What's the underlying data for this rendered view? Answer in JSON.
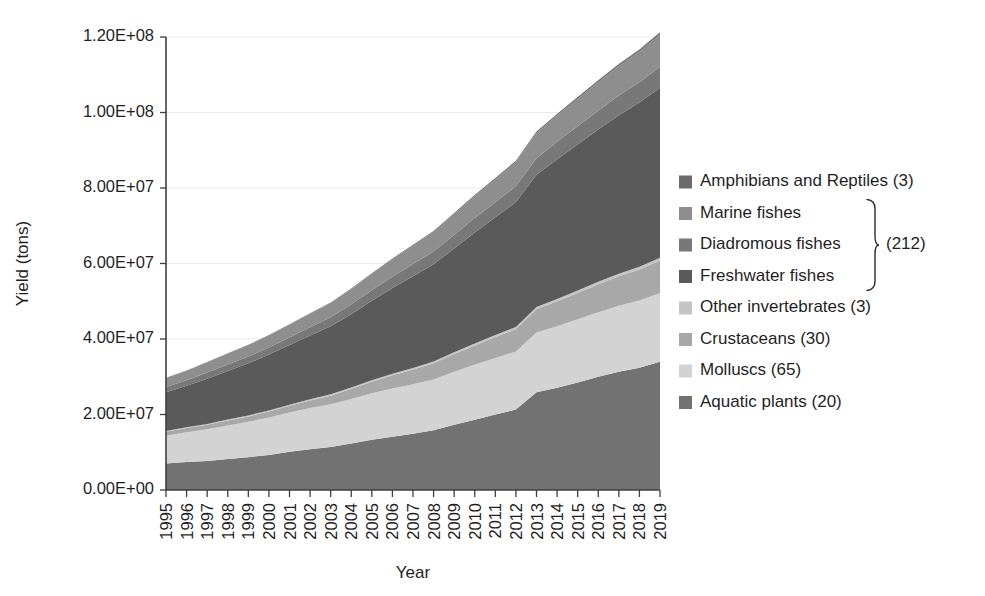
{
  "chart_data": {
    "type": "area",
    "stacked": true,
    "title": "",
    "xlabel": "Year",
    "ylabel": "Yield (tons)",
    "grid": true,
    "legend_position": "right",
    "ylim": [
      0,
      120000000
    ],
    "ytick_labels": [
      "0.00E+00",
      "2.00E+07",
      "4.00E+07",
      "6.00E+07",
      "8.00E+07",
      "1.00E+08",
      "1.20E+08"
    ],
    "ytick_values": [
      0,
      20000000,
      40000000,
      60000000,
      80000000,
      100000000,
      120000000
    ],
    "categories": [
      1995,
      1996,
      1997,
      1998,
      1999,
      2000,
      2001,
      2002,
      2003,
      2004,
      2005,
      2006,
      2007,
      2008,
      2009,
      2010,
      2011,
      2012,
      2013,
      2014,
      2015,
      2016,
      2017,
      2018,
      2019
    ],
    "x": [
      "1995",
      "1996",
      "1997",
      "1998",
      "1999",
      "2000",
      "2001",
      "2002",
      "2003",
      "2004",
      "2005",
      "2006",
      "2007",
      "2008",
      "2009",
      "2010",
      "2011",
      "2012",
      "2013",
      "2014",
      "2015",
      "2016",
      "2017",
      "2018",
      "2019"
    ],
    "stack_order_bottom_to_top": [
      "Aquatic plants",
      "Molluscs",
      "Crustaceans",
      "Other invertebrates",
      "Freshwater fishes",
      "Diadromous fishes",
      "Marine fishes",
      "Amphibians and Reptiles"
    ],
    "series": [
      {
        "name": "Aquatic plants",
        "color": "#727272",
        "values": [
          7000000,
          7400000,
          7700000,
          8200000,
          8700000,
          9300000,
          10100000,
          10800000,
          11400000,
          12300000,
          13300000,
          14100000,
          14900000,
          15800000,
          17300000,
          18600000,
          20000000,
          21300000,
          25900000,
          27100000,
          28500000,
          30000000,
          31300000,
          32400000,
          34000000
        ]
      },
      {
        "name": "Molluscs",
        "color": "#d3d3d3",
        "values": [
          7400000,
          7900000,
          8400000,
          8900000,
          9400000,
          9900000,
          10400000,
          10900000,
          11300000,
          11800000,
          12300000,
          12800000,
          13100000,
          13500000,
          14000000,
          14600000,
          15000000,
          15400000,
          15800000,
          16300000,
          16700000,
          17100000,
          17500000,
          17800000,
          18200000
        ]
      },
      {
        "name": "Crustaceans",
        "color": "#a8a8a8",
        "values": [
          1000000,
          1100000,
          1200000,
          1300000,
          1400000,
          1600000,
          1800000,
          2000000,
          2300000,
          2700000,
          3100000,
          3500000,
          3900000,
          4300000,
          4700000,
          5100000,
          5500000,
          5900000,
          6200000,
          6600000,
          7000000,
          7400000,
          7800000,
          8200000,
          8600000
        ]
      },
      {
        "name": "Other invertebrates",
        "color": "#c4c4c4",
        "values": [
          200000,
          200000,
          200000,
          250000,
          250000,
          280000,
          300000,
          320000,
          350000,
          380000,
          400000,
          420000,
          450000,
          470000,
          500000,
          520000,
          550000,
          570000,
          600000,
          620000,
          650000,
          680000,
          700000,
          720000,
          750000
        ]
      },
      {
        "name": "Freshwater fishes",
        "color": "#5a5a5a",
        "values": [
          10300000,
          11000000,
          12000000,
          12900000,
          13800000,
          14800000,
          15800000,
          16900000,
          18000000,
          19400000,
          21000000,
          22700000,
          24300000,
          25700000,
          27500000,
          29400000,
          31200000,
          33100000,
          35000000,
          37000000,
          38700000,
          40300000,
          42000000,
          43500000,
          45000000
        ]
      },
      {
        "name": "Diadromous fishes",
        "color": "#787878",
        "values": [
          1400000,
          1500000,
          1600000,
          1700000,
          1800000,
          1900000,
          2000000,
          2200000,
          2400000,
          2600000,
          2800000,
          3000000,
          3200000,
          3400000,
          3600000,
          3800000,
          4000000,
          4200000,
          4400000,
          4600000,
          4800000,
          5000000,
          5200000,
          5400000,
          5600000
        ]
      },
      {
        "name": "Marine fishes",
        "color": "#8e8e8e",
        "values": [
          2400000,
          2500000,
          2700000,
          2900000,
          3000000,
          3200000,
          3400000,
          3600000,
          3800000,
          4000000,
          4300000,
          4600000,
          4900000,
          5200000,
          5500000,
          5800000,
          6100000,
          6400000,
          6700000,
          7000000,
          7300000,
          7600000,
          7900000,
          8200000,
          8600000
        ]
      },
      {
        "name": "Amphibians and Reptiles",
        "color": "#6b6b6b",
        "values": [
          60000,
          70000,
          80000,
          90000,
          100000,
          110000,
          120000,
          130000,
          150000,
          170000,
          190000,
          210000,
          230000,
          250000,
          280000,
          300000,
          330000,
          350000,
          380000,
          400000,
          430000,
          450000,
          480000,
          500000,
          530000
        ]
      }
    ],
    "legend": [
      {
        "label": "Amphibians and Reptiles (3)",
        "color": "#6b6b6b"
      },
      {
        "label": "Marine fishes",
        "color": "#8e8e8e"
      },
      {
        "label": "Diadromous fishes",
        "color": "#787878"
      },
      {
        "label": "Freshwater fishes",
        "color": "#5a5a5a"
      },
      {
        "label": "Other invertebrates (3)",
        "color": "#c4c4c4"
      },
      {
        "label": "Crustaceans (30)",
        "color": "#a8a8a8"
      },
      {
        "label": "Molluscs (65)",
        "color": "#d3d3d3"
      },
      {
        "label": "Aquatic plants (20)",
        "color": "#727272"
      }
    ],
    "legend_brace_label": "(212)",
    "legend_brace_members": [
      "Marine fishes",
      "Diadromous fishes",
      "Freshwater fishes"
    ]
  },
  "colors": {
    "axis": "#3f3f3f",
    "grid": "#e9e9e9",
    "text": "#1f1f1f",
    "background": "#ffffff"
  }
}
